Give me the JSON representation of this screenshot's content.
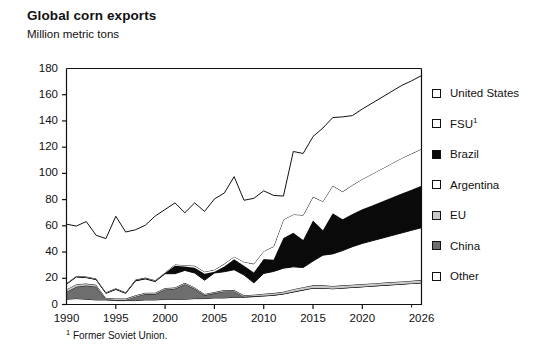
{
  "header": {
    "title": "Global corn exports",
    "subtitle": "Million metric tons"
  },
  "footnote": {
    "marker": "1",
    "text": "Former Soviet Union."
  },
  "legend": {
    "items": [
      {
        "label": "United States",
        "swatch": "white",
        "color": "#ffffff"
      },
      {
        "label": "FSU",
        "swatch": "white",
        "color": "#ffffff",
        "sup": "1"
      },
      {
        "label": "Brazil",
        "swatch": "black",
        "color": "#0a0a0a"
      },
      {
        "label": "Argentina",
        "swatch": "white",
        "color": "#ffffff"
      },
      {
        "label": "EU",
        "swatch": "ltgray",
        "color": "#c9c9c9"
      },
      {
        "label": "China",
        "swatch": "dkgray",
        "color": "#6e6e6e"
      },
      {
        "label": "Other",
        "swatch": "white",
        "color": "#ffffff"
      }
    ]
  },
  "axes": {
    "y_ticks": [
      "180",
      "160",
      "140",
      "120",
      "100",
      "80",
      "60",
      "40",
      "20",
      "0"
    ],
    "x_ticks": [
      "1990",
      "1995",
      "2000",
      "2005",
      "2010",
      "2015",
      "2020",
      "2026"
    ]
  },
  "chart_data": {
    "type": "area",
    "title": "Global corn exports",
    "subtitle": "Million metric tons",
    "xlabel": "",
    "ylabel": "Million metric tons",
    "ylim": [
      0,
      180
    ],
    "ytick_step": 20,
    "xlim": [
      1990,
      2026
    ],
    "xtick_values": [
      1990,
      1995,
      2000,
      2005,
      2010,
      2015,
      2020,
      2026
    ],
    "grid": false,
    "legend_position": "right",
    "stacked": true,
    "stack_order_bottom_to_top": [
      "Other",
      "China",
      "EU",
      "Argentina",
      "Brazil",
      "FSU",
      "United States"
    ],
    "x": [
      1990,
      1991,
      1992,
      1993,
      1994,
      1995,
      1996,
      1997,
      1998,
      1999,
      2000,
      2001,
      2002,
      2003,
      2004,
      2005,
      2006,
      2007,
      2008,
      2009,
      2010,
      2011,
      2012,
      2013,
      2014,
      2015,
      2016,
      2017,
      2018,
      2019,
      2020,
      2021,
      2022,
      2023,
      2024,
      2025,
      2026
    ],
    "series": [
      {
        "name": "Other",
        "color": "#ffffff",
        "values": [
          4.0,
          4.5,
          4.0,
          3.5,
          3.5,
          3.0,
          3.0,
          3.0,
          3.5,
          3.5,
          4.0,
          4.0,
          4.0,
          4.5,
          4.5,
          5.0,
          5.0,
          5.5,
          5.5,
          6.0,
          6.5,
          7.0,
          8.0,
          9.5,
          11.0,
          12.5,
          12.5,
          12.0,
          12.5,
          13.0,
          13.5,
          14.0,
          14.5,
          15.0,
          15.5,
          16.0,
          16.5
        ]
      },
      {
        "name": "China",
        "color": "#6e6e6e",
        "values": [
          5.5,
          9.0,
          10.5,
          10.0,
          0.5,
          0.5,
          0.5,
          3.0,
          4.5,
          4.5,
          7.5,
          8.0,
          11.5,
          7.5,
          2.5,
          3.5,
          5.0,
          4.5,
          0.5,
          0.5,
          0.2,
          0.2,
          0.2,
          0.2,
          0.2,
          0.1,
          0.1,
          0.1,
          0.1,
          0.1,
          0.1,
          0.1,
          0.1,
          0.1,
          0.1,
          0.1,
          0.1
        ]
      },
      {
        "name": "EU",
        "color": "#c9c9c9",
        "values": [
          2.0,
          2.0,
          1.5,
          1.5,
          1.0,
          1.0,
          1.0,
          1.0,
          1.0,
          1.0,
          1.0,
          1.0,
          1.0,
          1.0,
          1.0,
          1.0,
          1.0,
          1.0,
          1.0,
          1.0,
          1.5,
          1.5,
          1.5,
          2.0,
          2.0,
          2.0,
          2.0,
          2.0,
          2.0,
          2.0,
          2.0,
          2.0,
          2.0,
          2.0,
          2.0,
          2.0,
          2.0
        ]
      },
      {
        "name": "Argentina",
        "color": "#ffffff",
        "values": [
          4.0,
          5.5,
          4.5,
          4.0,
          3.5,
          7.0,
          4.0,
          11.0,
          10.5,
          8.5,
          11.0,
          10.5,
          9.5,
          11.0,
          10.5,
          14.5,
          14.0,
          15.5,
          15.5,
          9.0,
          15.5,
          16.5,
          18.0,
          17.0,
          15.0,
          18.5,
          23.0,
          24.5,
          26.5,
          29.0,
          31.0,
          32.5,
          34.0,
          35.5,
          37.0,
          38.5,
          40.0
        ]
      },
      {
        "name": "Brazil",
        "color": "#0a0a0a",
        "values": [
          0.3,
          0.3,
          0.3,
          0.3,
          0.3,
          0.3,
          0.3,
          0.5,
          0.5,
          0.5,
          0.5,
          6.0,
          3.0,
          4.0,
          5.0,
          1.0,
          4.0,
          8.0,
          7.0,
          8.0,
          11.0,
          9.0,
          23.0,
          26.0,
          21.0,
          31.0,
          19.0,
          31.0,
          24.0,
          25.0,
          26.0,
          27.0,
          28.0,
          29.0,
          30.0,
          31.0,
          32.0
        ]
      },
      {
        "name": "FSU",
        "color": "#ffffff",
        "values": [
          0.5,
          0.5,
          0.5,
          0.5,
          0.5,
          0.5,
          0.5,
          0.5,
          0.5,
          0.5,
          0.5,
          1.0,
          1.0,
          1.5,
          1.5,
          1.5,
          2.0,
          2.0,
          3.0,
          6.5,
          6.0,
          10.0,
          14.0,
          14.0,
          19.0,
          18.0,
          22.0,
          21.0,
          21.0,
          22.0,
          23.0,
          24.0,
          25.0,
          26.0,
          27.0,
          27.5,
          28.0
        ]
      },
      {
        "name": "United States",
        "color": "#ffffff",
        "values": [
          45.0,
          38.0,
          42.0,
          33.0,
          41.0,
          55.0,
          46.0,
          38.0,
          40.0,
          49.0,
          48.0,
          47.0,
          40.0,
          48.0,
          46.0,
          54.0,
          54.0,
          61.0,
          47.0,
          50.0,
          46.0,
          39.0,
          18.0,
          48.0,
          47.0,
          46.0,
          56.0,
          52.0,
          57.0,
          53.0,
          53.5,
          54.0,
          54.5,
          55.0,
          55.5,
          55.5,
          56.0
        ]
      }
    ]
  }
}
